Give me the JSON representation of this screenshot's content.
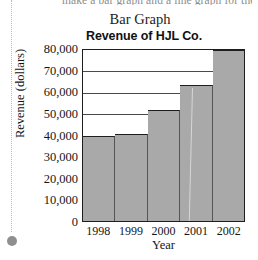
{
  "page": {
    "cut_off_top_line": "make a bar graph and a line graph for the",
    "caption": "Bar Graph"
  },
  "chart_data": {
    "type": "bar",
    "title": "Revenue of HJL Co.",
    "xlabel": "Year",
    "ylabel": "Revenue (dollars)",
    "categories": [
      "1998",
      "1999",
      "2000",
      "2001",
      "2002"
    ],
    "values": [
      40000,
      40500,
      52000,
      63500,
      80000
    ],
    "ylim": [
      0,
      80000
    ],
    "y_ticks": [
      0,
      10000,
      20000,
      30000,
      40000,
      50000,
      60000,
      70000,
      80000
    ],
    "y_tick_labels": [
      "0",
      "10,000",
      "20,000",
      "30,000",
      "40,000",
      "50,000",
      "60,000",
      "70,000",
      "80,000"
    ],
    "grid": true,
    "grid_axis": "y",
    "legend": false,
    "bar_color": "#a9a9a9",
    "bar_edge_color": "#1e1e1e",
    "axis_color": "#1e1e1e",
    "bar_gap": 0
  }
}
